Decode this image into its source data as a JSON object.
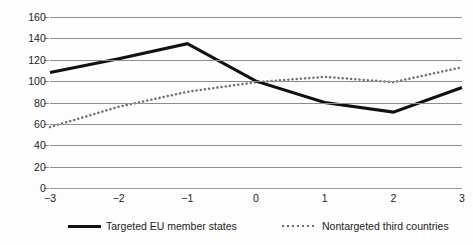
{
  "chart_data": {
    "type": "line",
    "title": "",
    "xlabel": "",
    "ylabel": "",
    "x": [
      -3,
      -2,
      -1,
      0,
      1,
      2,
      3
    ],
    "xtick_labels": [
      "−3",
      "−2",
      "−1",
      "0",
      "1",
      "2",
      "3"
    ],
    "ytick_labels": [
      "0",
      "20",
      "40",
      "60",
      "80",
      "100",
      "120",
      "140",
      "160"
    ],
    "ytick_values": [
      0,
      20,
      40,
      60,
      80,
      100,
      120,
      140,
      160
    ],
    "ylim": [
      0,
      160
    ],
    "xlim": [
      -3,
      3
    ],
    "grid": "horizontal",
    "legend_position": "bottom",
    "series": [
      {
        "name": "Targeted EU member states",
        "style": "solid",
        "color": "#111111",
        "values": [
          108,
          121,
          135,
          100,
          80,
          71,
          94
        ]
      },
      {
        "name": "Nontargeted third countries",
        "style": "dotted",
        "color": "#6f6f6f",
        "values": [
          57,
          76,
          90,
          99,
          104,
          99,
          113
        ]
      }
    ]
  },
  "legend": {
    "entries": [
      {
        "label": "Targeted EU member states"
      },
      {
        "label": "Nontargeted third countries"
      }
    ]
  },
  "colors": {
    "gridline": "#8d8d8d",
    "solid_series": "#111111",
    "dotted_series": "#6f6f6f",
    "background": "#fdfdfd"
  }
}
